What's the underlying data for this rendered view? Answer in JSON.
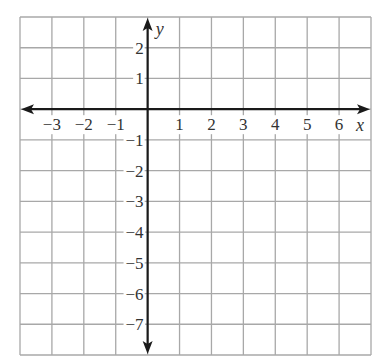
{
  "chart_data": {
    "type": "coordinate-grid",
    "title": "",
    "xlabel": "x",
    "ylabel": "y",
    "xlim": [
      -4,
      7
    ],
    "ylim": [
      -8,
      3
    ],
    "grid": true,
    "x_ticks": [
      -3,
      -2,
      -1,
      1,
      2,
      3,
      4,
      5,
      6
    ],
    "x_tick_labels": [
      "−3",
      "−2",
      "−1",
      "1",
      "2",
      "3",
      "4",
      "5",
      "6"
    ],
    "y_ticks": [
      2,
      1,
      -1,
      -2,
      -3,
      -4,
      -5,
      -6,
      -7
    ],
    "y_tick_labels": [
      "2",
      "1",
      "−1",
      "−2",
      "−3",
      "−4",
      "−5",
      "−6",
      "−7"
    ],
    "series": [],
    "legend": null
  },
  "style": {
    "grid_color": "#a8a8a8",
    "axis_color": "#1a1a1a",
    "label_color": "#333333",
    "background": "#ffffff"
  },
  "layout": {
    "left": 20,
    "right": 371,
    "top": 17,
    "bottom": 355,
    "origin_x": 147.6,
    "origin_y": 109.2
  }
}
